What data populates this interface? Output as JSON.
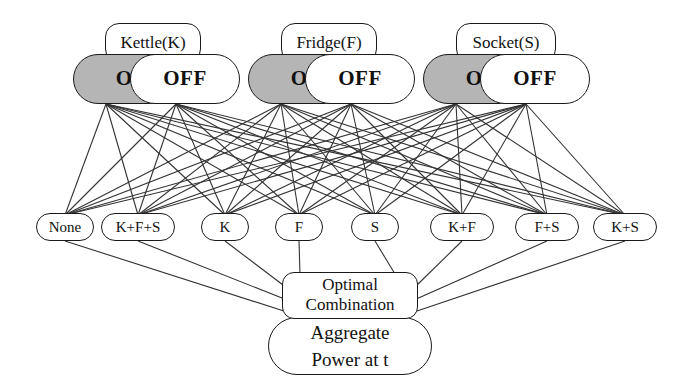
{
  "diagram": {
    "colors": {
      "on_state_fill": "#b5b5b5",
      "off_state_fill": "#ffffff",
      "node_stroke": "#1a1a1a",
      "edge_stroke": "#333333",
      "background": "#ffffff"
    },
    "devices": [
      {
        "label": "Kettle(K)",
        "states": [
          {
            "label": "ON",
            "selected": true
          },
          {
            "label": "OFF",
            "selected": false
          }
        ]
      },
      {
        "label": "Fridge(F)",
        "states": [
          {
            "label": "ON",
            "selected": true
          },
          {
            "label": "OFF",
            "selected": false
          }
        ]
      },
      {
        "label": "Socket(S)",
        "states": [
          {
            "label": "ON",
            "selected": true
          },
          {
            "label": "OFF",
            "selected": false
          }
        ]
      }
    ],
    "combinations": [
      {
        "label": "None"
      },
      {
        "label": "K+F+S"
      },
      {
        "label": "K"
      },
      {
        "label": "F"
      },
      {
        "label": "S"
      },
      {
        "label": "K+F"
      },
      {
        "label": "F+S"
      },
      {
        "label": "K+S"
      }
    ],
    "optimal": {
      "line1": "Optimal",
      "line2": "Combination"
    },
    "aggregate": {
      "line1": "Aggregate",
      "line2": "Power at t"
    }
  }
}
